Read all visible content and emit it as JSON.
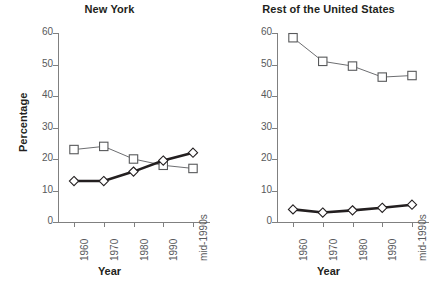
{
  "figure": {
    "width": 438,
    "height": 298,
    "background": "#ffffff"
  },
  "chart_data": [
    {
      "type": "line",
      "title": "New York",
      "xlabel": "Year",
      "ylabel": "Percentage",
      "categories": [
        "1960",
        "1970",
        "1980",
        "1990",
        "mid-1990s"
      ],
      "ylim": [
        0,
        60
      ],
      "yticks": [
        0,
        10,
        20,
        30,
        40,
        50,
        60
      ],
      "grid": false,
      "legend": "none",
      "series": [
        {
          "name": "square-series",
          "marker": "open-square",
          "line_style": "thin",
          "color": "#6d6e71",
          "values": [
            23,
            24,
            20,
            18,
            17
          ]
        },
        {
          "name": "diamond-series",
          "marker": "open-diamond",
          "line_style": "thick",
          "color": "#231f20",
          "values": [
            13,
            13,
            16,
            19.5,
            22
          ]
        }
      ]
    },
    {
      "type": "line",
      "title": "Rest of the United States",
      "xlabel": "Year",
      "ylabel": "Percentage",
      "categories": [
        "1960",
        "1970",
        "1980",
        "1990",
        "mid-1990s"
      ],
      "ylim": [
        0,
        60
      ],
      "yticks": [
        0,
        10,
        20,
        30,
        40,
        50,
        60
      ],
      "grid": false,
      "legend": "none",
      "series": [
        {
          "name": "square-series",
          "marker": "open-square",
          "line_style": "thin",
          "color": "#6d6e71",
          "values": [
            58.5,
            51,
            49.5,
            46,
            46.5
          ]
        },
        {
          "name": "diamond-series",
          "marker": "open-diamond",
          "line_style": "thick",
          "color": "#231f20",
          "values": [
            4,
            3,
            3.7,
            4.5,
            5.5
          ]
        }
      ]
    }
  ]
}
